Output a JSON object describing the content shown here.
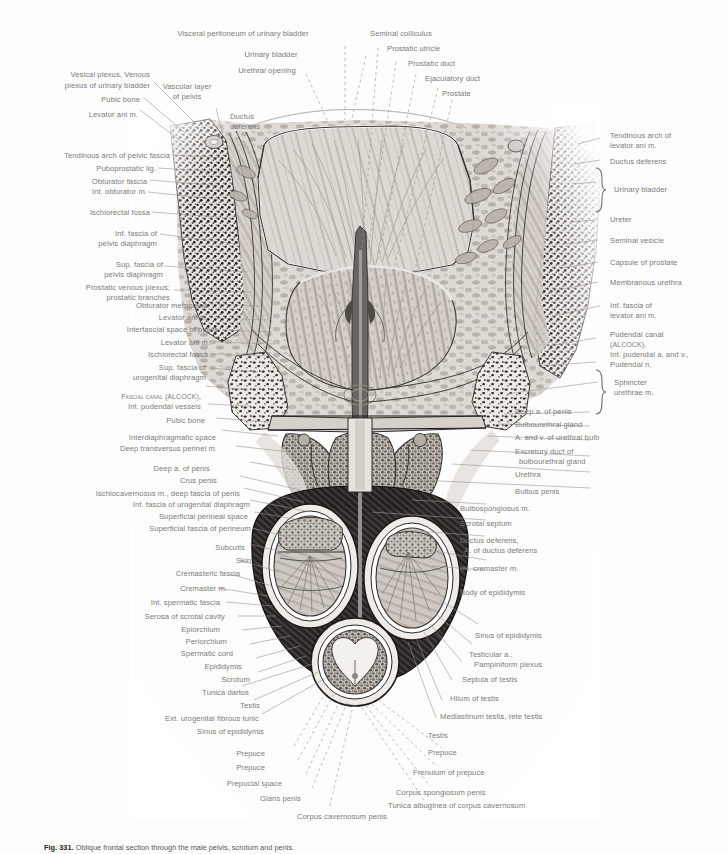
{
  "figure": {
    "title": "Oblique frontal section through the male pelvis, scrotum and penis",
    "number": "Fig. 331",
    "caption_lead": "Fig. 331.",
    "caption_text": "Oblique frontal section through the male pelvis, scrotum and penis.",
    "background_color": "#fdfdfd",
    "label_color": "#7a7a7a",
    "leader_color": "#8d8d8d"
  },
  "labels_top": [
    {
      "text": "Visceral peritoneum of urinary bladder",
      "align": "c"
    },
    {
      "text": "Urinary bladder",
      "align": "c"
    },
    {
      "text": "Urethral opening",
      "align": "c"
    },
    {
      "text": "Seminal colliculus",
      "align": "l"
    },
    {
      "text": "Prostatic utricle",
      "align": "l"
    },
    {
      "text": "Prostatic duct",
      "align": "l"
    },
    {
      "text": "Ejaculatory duct",
      "align": "l"
    },
    {
      "text": "Prostate",
      "align": "l"
    }
  ],
  "labels_left": [
    "Vesical plexus, Venous",
    "plexus of urinary bladder",
    "Pubic bone",
    "Levator ani m.",
    "Vascular layer",
    "of pelvis",
    "Ductus",
    "deferens",
    "Tendinous arch of pelvic fascia",
    "Puboprostatic lig.",
    "Obturator fascia",
    "Int. obturator m.",
    "Ischiorectal fossa",
    "Inf. fascia of",
    "pelvis diaphragm",
    "Sup. fascia of",
    "pelvis diaphragm",
    "Prostatic venous plexus;",
    "prostatic branches",
    "Obturator membrane",
    "Levator ani m.",
    "Interfascial space of pelvis",
    "Levator ani m.",
    "Ischiorectal fossa",
    "Sup. fascia of",
    "urogenital diaphragm",
    "Fascial canal (ALCOCK),",
    "Int. pudendal vessels",
    "Pubic bone",
    "Interdiaphragmatic space",
    "Deep transversus perinei m.",
    "Deep a. of penis",
    "Crus penis",
    "Ischiocavernosus m., deep fascia of penis",
    "Inf. fascia of urogenital diaphragm",
    "Superficial perineal space",
    "Superficial fascia of perineum",
    "Subcutis",
    "Skin",
    "Cremasteric fascia",
    "Cremaster m.",
    "Int. spermatic fascia",
    "Serosa of scrotal cavity",
    "Epiorchium",
    "Periorchium",
    "Spermatic cord",
    "Epididymis",
    "Scrotum",
    "Tunica dartos",
    "Testis",
    "Ext. urogenital fibrous tunic",
    "Sinus of epididymis",
    "Prepuce",
    "Prepuce",
    "Prepucial space",
    "Glans penis",
    "Corpus cavernosum penis"
  ],
  "labels_right": [
    "Tendinous arch of",
    "levator ani m.",
    "Ductus deferens",
    "Urinary bladder",
    "Ureter",
    "Seminal vesicle",
    "Capsule of prostate",
    "Membranous urethra",
    "Inf. fascia of",
    "levator ani m.",
    "Pudendal canal",
    "(ALCOCK),",
    "Int. pudendal a. and v.,",
    "Pudendal n.",
    "Sphincter",
    "urethrae m.",
    "Deep a. of penis",
    "Bulbourethral gland",
    "A. and v. of urethral bulb",
    "Excretory duct of",
    "bulbourethral gland",
    "Urethra",
    "Bulbus penis",
    "Bulbospongiosus m.",
    "Scrotal septum",
    "Ductus deferens,",
    "A. of ductus deferens",
    "Int. cremaster m.",
    "Body of epididymis",
    "Sinus of epididymis",
    "Testicular a.,",
    "Pampiniform plexus",
    "Septula of testis",
    "Hilum of testis",
    "Mediastinum testis, rete testis",
    "Testis",
    "Prepuce",
    "Frenulum of prepuce",
    "Corpus spongiosum penis",
    "Tunica albuginea of corpus cavernosum"
  ],
  "annotations": {
    "bracket_urinary_bladder": "Urinary bladder",
    "bracket_sphincter": "Sphincter urethrae m."
  }
}
